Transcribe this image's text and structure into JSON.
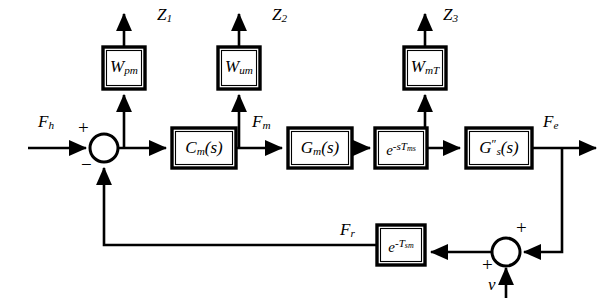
{
  "diagram": {
    "type": "block-diagram",
    "background_color": "#ffffff",
    "line_color": "#000000",
    "blocks": [
      {
        "id": "w-pm",
        "label_main": "W",
        "label_sub": "pm",
        "x": 103,
        "y": 47,
        "w": 42,
        "h": 42
      },
      {
        "id": "w-um",
        "label_main": "W",
        "label_sub": "um",
        "x": 218,
        "y": 47,
        "w": 42,
        "h": 42
      },
      {
        "id": "w-mt",
        "label_main": "W",
        "label_sub": "mT",
        "x": 404,
        "y": 47,
        "w": 42,
        "h": 42
      },
      {
        "id": "c-m",
        "label_main": "C",
        "label_sub": "m",
        "label_tail": "(s)",
        "x": 172,
        "y": 128,
        "w": 64,
        "h": 40
      },
      {
        "id": "g-m",
        "label_main": "G",
        "label_sub": "m",
        "label_tail": "(s)",
        "x": 288,
        "y": 128,
        "w": 64,
        "h": 40
      },
      {
        "id": "delay-ms",
        "label_exp": "e",
        "exp_main": "-sT",
        "exp_sub": "ms",
        "x": 375,
        "y": 128,
        "w": 52,
        "h": 40
      },
      {
        "id": "g-s",
        "label_main": "G",
        "label_sub": "s",
        "label_sup": "″",
        "label_tail": "(s)",
        "x": 466,
        "y": 128,
        "w": 66,
        "h": 40
      },
      {
        "id": "delay-sm",
        "label_exp": "e",
        "exp_main": "-T",
        "exp_sub": "sm",
        "x": 377,
        "y": 225,
        "w": 48,
        "h": 40
      }
    ],
    "summing_junctions": [
      {
        "id": "sum-left",
        "cx": 104,
        "cy": 148,
        "r": 14,
        "signs": [
          {
            "text": "+",
            "x": 78,
            "y": 118
          },
          {
            "text": "−",
            "x": 81,
            "y": 155
          }
        ]
      },
      {
        "id": "sum-right",
        "cx": 506,
        "cy": 252,
        "r": 14,
        "signs": [
          {
            "text": "+",
            "x": 516,
            "y": 218
          },
          {
            "text": "+",
            "x": 482,
            "y": 255
          }
        ]
      }
    ],
    "signal_labels": [
      {
        "id": "z1",
        "main": "Z",
        "sub": "1",
        "x": 157,
        "y": 6
      },
      {
        "id": "z2",
        "main": "Z",
        "sub": "2",
        "x": 272,
        "y": 6
      },
      {
        "id": "z3",
        "main": "Z",
        "sub": "3",
        "x": 443,
        "y": 6
      },
      {
        "id": "fh",
        "main": "F",
        "sub": "h",
        "x": 38,
        "y": 113
      },
      {
        "id": "fm",
        "main": "F",
        "sub": "m",
        "x": 252,
        "y": 113
      },
      {
        "id": "fe",
        "main": "F",
        "sub": "e",
        "x": 543,
        "y": 113
      },
      {
        "id": "fr",
        "main": "F",
        "sub": "r",
        "x": 340,
        "y": 221
      },
      {
        "id": "v",
        "main": "v",
        "sub": "",
        "x": 488,
        "y": 276
      }
    ],
    "connections": [
      {
        "from": "input-Fh",
        "to": "sum-left"
      },
      {
        "from": "sum-left",
        "to": "c-m"
      },
      {
        "from": "c-m",
        "to": "g-m"
      },
      {
        "from": "g-m",
        "to": "delay-ms"
      },
      {
        "from": "delay-ms",
        "to": "g-s"
      },
      {
        "from": "g-s",
        "to": "output-Fe"
      },
      {
        "from": "sum-left-out",
        "to": "w-pm"
      },
      {
        "from": "c-m-out",
        "to": "w-um"
      },
      {
        "from": "delay-ms-out",
        "to": "w-mt"
      },
      {
        "from": "w-pm",
        "to": "Z1"
      },
      {
        "from": "w-um",
        "to": "Z2"
      },
      {
        "from": "w-mt",
        "to": "Z3"
      },
      {
        "from": "g-s-out",
        "to": "sum-right"
      },
      {
        "from": "v-input",
        "to": "sum-right"
      },
      {
        "from": "sum-right",
        "to": "delay-sm"
      },
      {
        "from": "delay-sm",
        "to": "sum-left-negative"
      }
    ]
  }
}
